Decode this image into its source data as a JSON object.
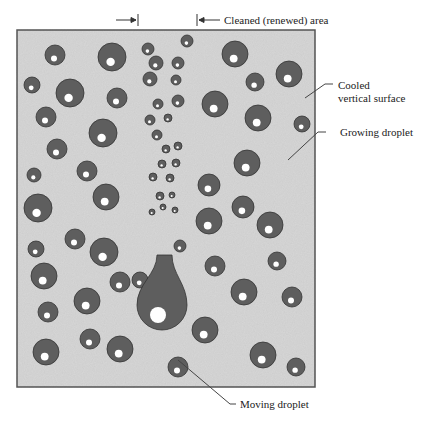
{
  "labels": {
    "cleaned_area": "Cleaned (renewed) area",
    "cooled_surface_line1": "Cooled",
    "cooled_surface_line2": "vertical surface",
    "growing_droplet": "Growing droplet",
    "moving_droplet": "Moving droplet"
  },
  "colors": {
    "surface": "#d6d6d6",
    "frame": "#555555",
    "droplet": "#5e5e5e",
    "droplet_edge": "#333333",
    "highlight": "#ffffff",
    "leader": "#444444"
  },
  "frame": {
    "x": 17,
    "y": 30,
    "w": 298,
    "h": 357
  },
  "droplets": [
    {
      "x": 55,
      "y": 55,
      "r": 10
    },
    {
      "x": 112,
      "y": 57,
      "r": 14
    },
    {
      "x": 148,
      "y": 49,
      "r": 6
    },
    {
      "x": 187,
      "y": 41,
      "r": 6
    },
    {
      "x": 235,
      "y": 54,
      "r": 13
    },
    {
      "x": 32,
      "y": 85,
      "r": 8
    },
    {
      "x": 70,
      "y": 93,
      "r": 14
    },
    {
      "x": 156,
      "y": 63,
      "r": 7
    },
    {
      "x": 178,
      "y": 63,
      "r": 6
    },
    {
      "x": 289,
      "y": 74,
      "r": 13
    },
    {
      "x": 255,
      "y": 82,
      "r": 9
    },
    {
      "x": 46,
      "y": 117,
      "r": 10
    },
    {
      "x": 117,
      "y": 98,
      "r": 10
    },
    {
      "x": 215,
      "y": 104,
      "r": 13
    },
    {
      "x": 150,
      "y": 79,
      "r": 7
    },
    {
      "x": 176,
      "y": 80,
      "r": 5
    },
    {
      "x": 258,
      "y": 118,
      "r": 13
    },
    {
      "x": 302,
      "y": 124,
      "r": 8
    },
    {
      "x": 57,
      "y": 149,
      "r": 10
    },
    {
      "x": 103,
      "y": 133,
      "r": 14
    },
    {
      "x": 158,
      "y": 104,
      "r": 5
    },
    {
      "x": 178,
      "y": 101,
      "r": 6
    },
    {
      "x": 150,
      "y": 120,
      "r": 5
    },
    {
      "x": 168,
      "y": 118,
      "r": 4
    },
    {
      "x": 157,
      "y": 135,
      "r": 5
    },
    {
      "x": 178,
      "y": 146,
      "r": 4
    },
    {
      "x": 166,
      "y": 149,
      "r": 4
    },
    {
      "x": 162,
      "y": 164,
      "r": 4
    },
    {
      "x": 176,
      "y": 163,
      "r": 4
    },
    {
      "x": 153,
      "y": 177,
      "r": 4
    },
    {
      "x": 170,
      "y": 178,
      "r": 4
    },
    {
      "x": 160,
      "y": 196,
      "r": 4
    },
    {
      "x": 172,
      "y": 195,
      "r": 3
    },
    {
      "x": 152,
      "y": 212,
      "r": 3
    },
    {
      "x": 163,
      "y": 207,
      "r": 3
    },
    {
      "x": 175,
      "y": 210,
      "r": 3
    },
    {
      "x": 34,
      "y": 175,
      "r": 7
    },
    {
      "x": 87,
      "y": 171,
      "r": 10
    },
    {
      "x": 247,
      "y": 163,
      "r": 13
    },
    {
      "x": 38,
      "y": 208,
      "r": 14
    },
    {
      "x": 106,
      "y": 197,
      "r": 13
    },
    {
      "x": 209,
      "y": 185,
      "r": 11
    },
    {
      "x": 243,
      "y": 207,
      "r": 11
    },
    {
      "x": 75,
      "y": 239,
      "r": 10
    },
    {
      "x": 209,
      "y": 221,
      "r": 13
    },
    {
      "x": 270,
      "y": 225,
      "r": 13
    },
    {
      "x": 36,
      "y": 249,
      "r": 8
    },
    {
      "x": 104,
      "y": 252,
      "r": 14
    },
    {
      "x": 44,
      "y": 276,
      "r": 13
    },
    {
      "x": 180,
      "y": 246,
      "r": 6
    },
    {
      "x": 215,
      "y": 266,
      "r": 10
    },
    {
      "x": 277,
      "y": 261,
      "r": 9
    },
    {
      "x": 120,
      "y": 282,
      "r": 10
    },
    {
      "x": 87,
      "y": 301,
      "r": 13
    },
    {
      "x": 244,
      "y": 292,
      "r": 13
    },
    {
      "x": 48,
      "y": 312,
      "r": 10
    },
    {
      "x": 292,
      "y": 297,
      "r": 10
    },
    {
      "x": 140,
      "y": 280,
      "r": 8
    },
    {
      "x": 205,
      "y": 330,
      "r": 13
    },
    {
      "x": 90,
      "y": 339,
      "r": 10
    },
    {
      "x": 46,
      "y": 352,
      "r": 13
    },
    {
      "x": 120,
      "y": 349,
      "r": 13
    },
    {
      "x": 178,
      "y": 367,
      "r": 10
    },
    {
      "x": 263,
      "y": 355,
      "r": 13
    },
    {
      "x": 296,
      "y": 367,
      "r": 9
    },
    {
      "x": 299,
      "y": 368,
      "r": 0
    }
  ],
  "moving_droplet": {
    "neck_top_y": 255,
    "neck_left": 157,
    "neck_right": 172,
    "bulb_cx": 162,
    "bulb_cy": 305,
    "bulb_r": 25
  }
}
